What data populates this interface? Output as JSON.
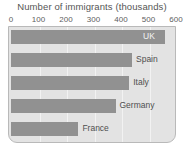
{
  "chart_data": {
    "type": "bar",
    "orientation": "horizontal",
    "title": "Number of immigrants (thousands)",
    "xlabel": "",
    "ylabel": "",
    "xlim": [
      0,
      600
    ],
    "xticks": [
      0,
      100,
      200,
      300,
      400,
      500,
      600
    ],
    "xtick_labels": [
      "0",
      "100",
      "200",
      "300",
      "400",
      "500",
      "600"
    ],
    "grid": true,
    "legend": "none",
    "categories": [
      "UK",
      "Spain",
      "Italy",
      "Germany",
      "France"
    ],
    "values": [
      560,
      440,
      430,
      380,
      245
    ],
    "bar_label_placement": [
      "inside",
      "outside",
      "outside",
      "outside",
      "outside"
    ],
    "colors": {
      "bar": "#919191",
      "plot_background": "#e3e3e3",
      "gridline": "#f2f2f2",
      "frame_border": "#b9b9b9",
      "title_text": "#555555",
      "tick_text": "#606060",
      "label_text_outside": "#4f4f4f",
      "label_text_inside": "#f4f4f4",
      "page_background": "#ffffff"
    }
  }
}
